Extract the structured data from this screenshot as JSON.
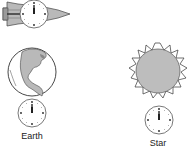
{
  "figure": {
    "objects": [
      {
        "id": "rocket",
        "icon": "rocket-with-clock-icon",
        "label": ""
      },
      {
        "id": "earth",
        "icon": "earth-globe-icon",
        "label": "Earth"
      },
      {
        "id": "star",
        "icon": "star-sun-icon",
        "label": "Star"
      }
    ],
    "clocks": [
      {
        "id": "rocket-clock",
        "time": "12:00"
      },
      {
        "id": "earth-clock",
        "time": "12:00"
      },
      {
        "id": "star-clock",
        "time": "12:00"
      }
    ],
    "labels": {
      "earth": "Earth",
      "star": "Star"
    },
    "colors": {
      "fill_gray": "#b9b9b9",
      "line": "#333333",
      "background": "#ffffff"
    }
  }
}
